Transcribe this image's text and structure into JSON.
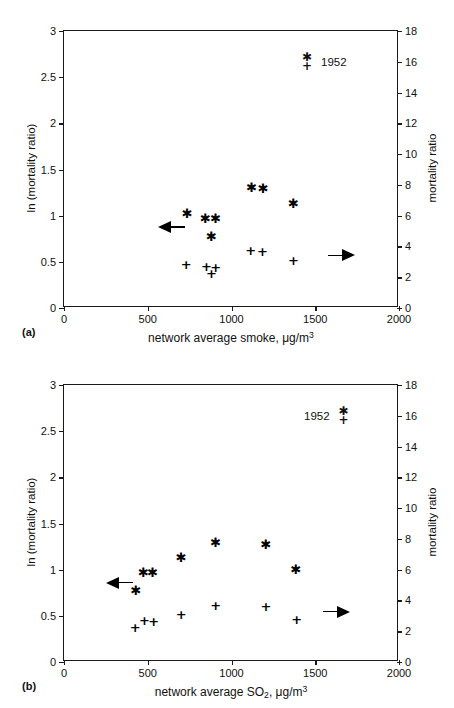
{
  "figures": [
    {
      "panel_label": "(a)",
      "legend_label": "1952",
      "legend_order": "markers-first",
      "chart_data": {
        "type": "scatter",
        "title": "",
        "xlabel": "network average smoke, μg/m3",
        "xlabel_parts": {
          "text": "network average smoke, μg/m",
          "sup": "3"
        },
        "ylabel": "ln (mortality ratio)",
        "ylabel_right": "mortality ratio",
        "xlim": [
          0,
          2000
        ],
        "ylim": [
          0,
          3
        ],
        "ylim_right": [
          0,
          18
        ],
        "xticks": [
          0,
          500,
          1000,
          1500,
          2000
        ],
        "xticklabels": [
          "0",
          "500",
          "1000",
          "1500",
          "2000"
        ],
        "yticks": [
          0,
          0.5,
          1,
          1.5,
          2,
          2.5,
          3
        ],
        "yticklabels": [
          "0",
          "0.5",
          "1",
          "1.5",
          "2",
          "2.5",
          "3"
        ],
        "yticks_right": [
          0,
          2,
          4,
          6,
          8,
          10,
          12,
          14,
          16,
          18
        ],
        "yticklabels_right": [
          "0",
          "2",
          "4",
          "6",
          "8",
          "10",
          "12",
          "14",
          "16",
          "18"
        ],
        "grid": false,
        "legend_position": "top-right",
        "series": [
          {
            "name": "ln (mortality ratio)",
            "marker": "asterisk",
            "axis": "left",
            "points": [
              {
                "x": 735,
                "y": 1.03
              },
              {
                "x": 845,
                "y": 0.98
              },
              {
                "x": 905,
                "y": 0.97
              },
              {
                "x": 880,
                "y": 0.78
              },
              {
                "x": 1120,
                "y": 1.31
              },
              {
                "x": 1190,
                "y": 1.3
              },
              {
                "x": 1370,
                "y": 1.14
              }
            ]
          },
          {
            "name": "mortality ratio",
            "marker": "plus",
            "axis": "right",
            "points": [
              {
                "x": 730,
                "y": 2.85
              },
              {
                "x": 850,
                "y": 2.7
              },
              {
                "x": 880,
                "y": 2.25
              },
              {
                "x": 905,
                "y": 2.65
              },
              {
                "x": 1115,
                "y": 3.75
              },
              {
                "x": 1185,
                "y": 3.7
              },
              {
                "x": 1370,
                "y": 3.15
              }
            ]
          }
        ],
        "annotations": [
          {
            "kind": "arrow",
            "direction": "left",
            "x": 560,
            "y": 0.88
          },
          {
            "kind": "arrow",
            "direction": "right",
            "x": 1575,
            "y": 0.57
          }
        ]
      }
    },
    {
      "panel_label": "(b)",
      "legend_label": "1952",
      "legend_order": "label-first",
      "chart_data": {
        "type": "scatter",
        "title": "",
        "xlabel": "network average SO2, μg/m3",
        "xlabel_parts": {
          "pre": "network average SO",
          "sub": "2",
          "mid": ",  μg/m",
          "sup": "3"
        },
        "ylabel": "ln (mortality ratio)",
        "ylabel_right": "mortality ratio",
        "xlim": [
          0,
          2000
        ],
        "ylim": [
          0,
          3
        ],
        "ylim_right": [
          0,
          18
        ],
        "xticks": [
          0,
          500,
          1000,
          1500,
          2000
        ],
        "xticklabels": [
          "0",
          "500",
          "1000",
          "1500",
          "2000"
        ],
        "yticks": [
          0,
          0.5,
          1,
          1.5,
          2,
          2.5,
          3
        ],
        "yticklabels": [
          "0",
          "0.5",
          "1",
          "1.5",
          "2",
          "2.5",
          "3"
        ],
        "yticks_right": [
          0,
          2,
          4,
          6,
          8,
          10,
          12,
          14,
          16,
          18
        ],
        "yticklabels_right": [
          "0",
          "2",
          "4",
          "6",
          "8",
          "10",
          "12",
          "14",
          "16",
          "18"
        ],
        "grid": false,
        "legend_position": "top-right",
        "series": [
          {
            "name": "ln (mortality ratio)",
            "marker": "asterisk",
            "axis": "left",
            "points": [
              {
                "x": 430,
                "y": 0.78
              },
              {
                "x": 475,
                "y": 0.98
              },
              {
                "x": 530,
                "y": 0.97
              },
              {
                "x": 700,
                "y": 1.14
              },
              {
                "x": 905,
                "y": 1.3
              },
              {
                "x": 1205,
                "y": 1.28
              },
              {
                "x": 1385,
                "y": 1.01
              }
            ]
          },
          {
            "name": "mortality ratio",
            "marker": "plus",
            "axis": "right",
            "points": [
              {
                "x": 425,
                "y": 2.25
              },
              {
                "x": 480,
                "y": 2.7
              },
              {
                "x": 535,
                "y": 2.65
              },
              {
                "x": 700,
                "y": 3.15
              },
              {
                "x": 905,
                "y": 3.7
              },
              {
                "x": 1205,
                "y": 3.65
              },
              {
                "x": 1390,
                "y": 2.8
              }
            ]
          }
        ],
        "annotations": [
          {
            "kind": "arrow",
            "direction": "left",
            "x": 250,
            "y": 0.86
          },
          {
            "kind": "arrow",
            "direction": "right",
            "x": 1545,
            "y": 0.545
          }
        ]
      }
    }
  ],
  "glyphs": {
    "asterisk": "✱",
    "plus": "+"
  }
}
